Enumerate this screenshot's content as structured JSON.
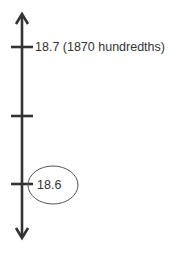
{
  "number_line": {
    "orientation": "vertical",
    "arrows": [
      "up",
      "down"
    ],
    "ticks": [
      {
        "position": "top",
        "label": "18.7 (1870 hundredths)"
      },
      {
        "position": "middle",
        "label": ""
      },
      {
        "position": "bottom",
        "label": "18.6",
        "circled": true
      }
    ]
  },
  "colors": {
    "line": "#333333",
    "ellipse": "#555555"
  }
}
